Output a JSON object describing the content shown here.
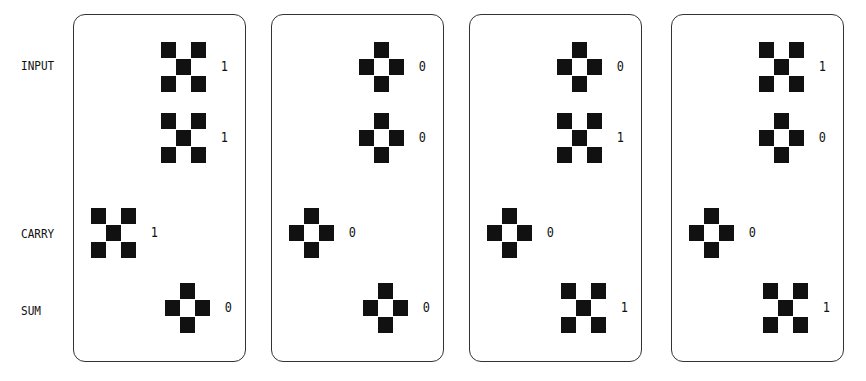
{
  "row_labels": {
    "input": "INPUT",
    "carry": "CARRY",
    "sum": "SUM"
  },
  "glyph_legend": {
    "1": "x-pattern (four corner squares plus center)",
    "0": "diamond-ring pattern (four edge squares, hollow center)"
  },
  "panels": [
    {
      "input_a": "1",
      "input_b": "1",
      "carry": "1",
      "sum": "0"
    },
    {
      "input_a": "0",
      "input_b": "0",
      "carry": "0",
      "sum": "0"
    },
    {
      "input_a": "0",
      "input_b": "1",
      "carry": "0",
      "sum": "1"
    },
    {
      "input_a": "1",
      "input_b": "0",
      "carry": "0",
      "sum": "1"
    }
  ],
  "colors": {
    "ink": "#111111",
    "background": "#ffffff",
    "border": "#333333"
  }
}
